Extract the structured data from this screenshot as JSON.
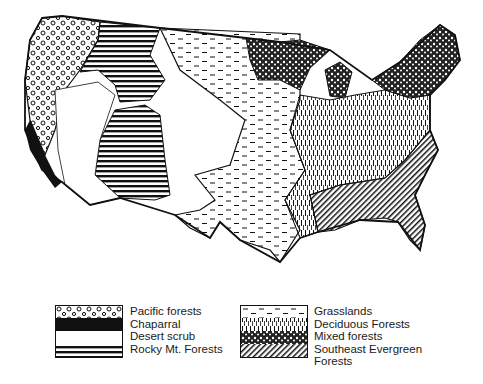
{
  "figure": {
    "colors": {
      "ink": "#111111",
      "paper": "#ffffff"
    }
  },
  "map": {
    "regions": [
      {
        "id": "pacific-forests",
        "label": "Pacific forests",
        "pattern": "circles"
      },
      {
        "id": "chaparral",
        "label": "Chaparral",
        "pattern": "solid-black"
      },
      {
        "id": "desert-scrub",
        "label": "Desert scrub",
        "pattern": "blank"
      },
      {
        "id": "rocky-mt-forests",
        "label": "Rocky Mt. Forests",
        "pattern": "horizontal-lines"
      },
      {
        "id": "grasslands",
        "label": "Grasslands",
        "pattern": "dashes"
      },
      {
        "id": "deciduous-forests",
        "label": "Deciduous Forests",
        "pattern": "vertical-dashes"
      },
      {
        "id": "mixed-forests",
        "label": "Mixed forests",
        "pattern": "dense-stipple"
      },
      {
        "id": "southeast-evergreen-forests",
        "label": "Southeast Evergreen Forests",
        "pattern": "diagonal-hatch"
      }
    ]
  },
  "legend": {
    "left": [
      {
        "label": "Pacific forests"
      },
      {
        "label": "Chaparral"
      },
      {
        "label": "Desert scrub"
      },
      {
        "label": "Rocky Mt. Forests"
      }
    ],
    "right": [
      {
        "label": "Grasslands"
      },
      {
        "label": "Deciduous Forests"
      },
      {
        "label": "Mixed forests"
      },
      {
        "label": "Southeast Evergreen"
      },
      {
        "label": "Forests"
      }
    ]
  }
}
